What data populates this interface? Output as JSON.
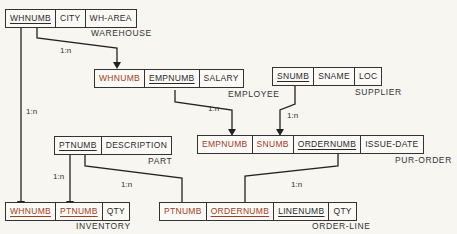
{
  "tables": {
    "warehouse": {
      "name": "WAREHOUSE",
      "fields": [
        "WHNUMB",
        "CITY",
        "WH-AREA"
      ]
    },
    "employee": {
      "name": "EMPLOYEE",
      "fields": [
        "WHNUMB",
        "EMPNUMB",
        "SALARY"
      ]
    },
    "supplier": {
      "name": "SUPPLIER",
      "fields": [
        "SNUMB",
        "SNAME",
        "LOC"
      ]
    },
    "pur_order": {
      "name": "PUR-ORDER",
      "fields": [
        "EMPNUMB",
        "SNUMB",
        "ORDERNUMB",
        "ISSUE-DATE"
      ]
    },
    "part": {
      "name": "PART",
      "fields": [
        "PTNUMB",
        "DESCRIPTION"
      ]
    },
    "inventory": {
      "name": "INVENTORY",
      "fields": [
        "WHNUMB",
        "PTNUMB",
        "QTY"
      ]
    },
    "order_line": {
      "name": "ORDER-LINE",
      "fields": [
        "PTNUMB",
        "ORDERNUMB",
        "LINENUMB",
        "QTY"
      ]
    }
  },
  "relationships": {
    "wh_emp": "1:n",
    "wh_inv": "1:n",
    "emp_po": "1:n",
    "sup_po": "1:n",
    "part_inv": "1:n",
    "part_ol": "1:n",
    "po_ol": "1:n"
  },
  "colors": {
    "foreign_key": "#a0401e",
    "line": "#222222"
  }
}
